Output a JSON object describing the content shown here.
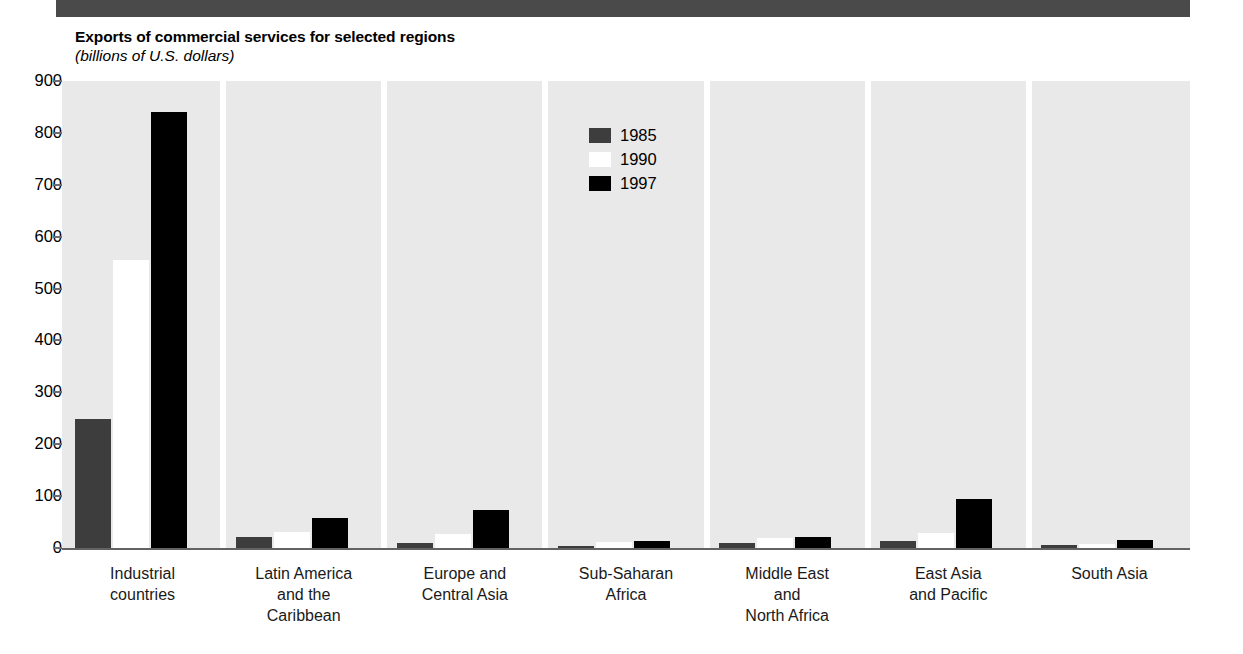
{
  "chart_data": {
    "type": "bar",
    "title": "Exports of commercial services for selected regions",
    "subtitle": "(billions of U.S. dollars)",
    "xlabel": "",
    "ylabel": "",
    "ylim": [
      0,
      900
    ],
    "ytick_step": 100,
    "yticks": [
      "900",
      "800",
      "700",
      "600",
      "500",
      "400",
      "300",
      "200",
      "100",
      "0"
    ],
    "grid": false,
    "legend_position": "inside-top-center",
    "categories": [
      "Industrial\ncountries",
      "Latin America\nand the\nCaribbean",
      "Europe and\nCentral Asia",
      "Sub-Saharan\nAfrica",
      "Middle East\nand\nNorth Africa",
      "East Asia\nand Pacific",
      "South Asia"
    ],
    "category_lines": [
      [
        "Industrial",
        "countries"
      ],
      [
        "Latin America",
        "and the",
        "Caribbean"
      ],
      [
        "Europe and",
        "Central Asia"
      ],
      [
        "Sub-Saharan",
        "Africa"
      ],
      [
        "Middle East",
        "and",
        "North Africa"
      ],
      [
        "East Asia",
        "and Pacific"
      ],
      [
        "South Asia"
      ]
    ],
    "series": [
      {
        "name": "1985",
        "color": "#3d3d3d",
        "values": [
          248,
          22,
          10,
          3,
          10,
          13,
          5
        ]
      },
      {
        "name": "1990",
        "color": "#ffffff",
        "values": [
          555,
          30,
          27,
          11,
          19,
          28,
          8
        ]
      },
      {
        "name": "1997",
        "color": "#000000",
        "values": [
          840,
          58,
          73,
          13,
          22,
          94,
          15
        ]
      }
    ]
  },
  "legend": {
    "entries": [
      {
        "label": "1985",
        "color": "#3d3d3d"
      },
      {
        "label": "1990",
        "color": "#ffffff"
      },
      {
        "label": "1997",
        "color": "#000000"
      }
    ]
  },
  "colors": {
    "header_rule": "#4a4a4a",
    "plot_background": "#e9e9e9",
    "axis_line": "#636363",
    "series_1985": "#3d3d3d",
    "series_1990": "#ffffff",
    "series_1997": "#000000",
    "page_background": "#ffffff"
  }
}
